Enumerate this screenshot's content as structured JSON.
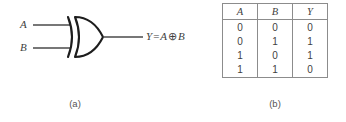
{
  "figure_a": {
    "caption": "(a)",
    "gate_type": "xor-gate",
    "inputs": [
      {
        "label": "A"
      },
      {
        "label": "B"
      }
    ],
    "output": {
      "y": "Y",
      "equals": "=",
      "operand_a": "A",
      "operator": "⊕",
      "operand_b": "B"
    }
  },
  "figure_b": {
    "caption": "(b)",
    "table": {
      "headers": [
        "A",
        "B",
        "Y"
      ],
      "rows": [
        [
          "0",
          "0",
          "0"
        ],
        [
          "0",
          "1",
          "1"
        ],
        [
          "1",
          "0",
          "1"
        ],
        [
          "1",
          "1",
          "0"
        ]
      ]
    }
  },
  "colors": {
    "ink": "#3f3f3f",
    "line": "#4a4a4a",
    "table_border": "#8c8c8c",
    "background": "#ffffff"
  }
}
